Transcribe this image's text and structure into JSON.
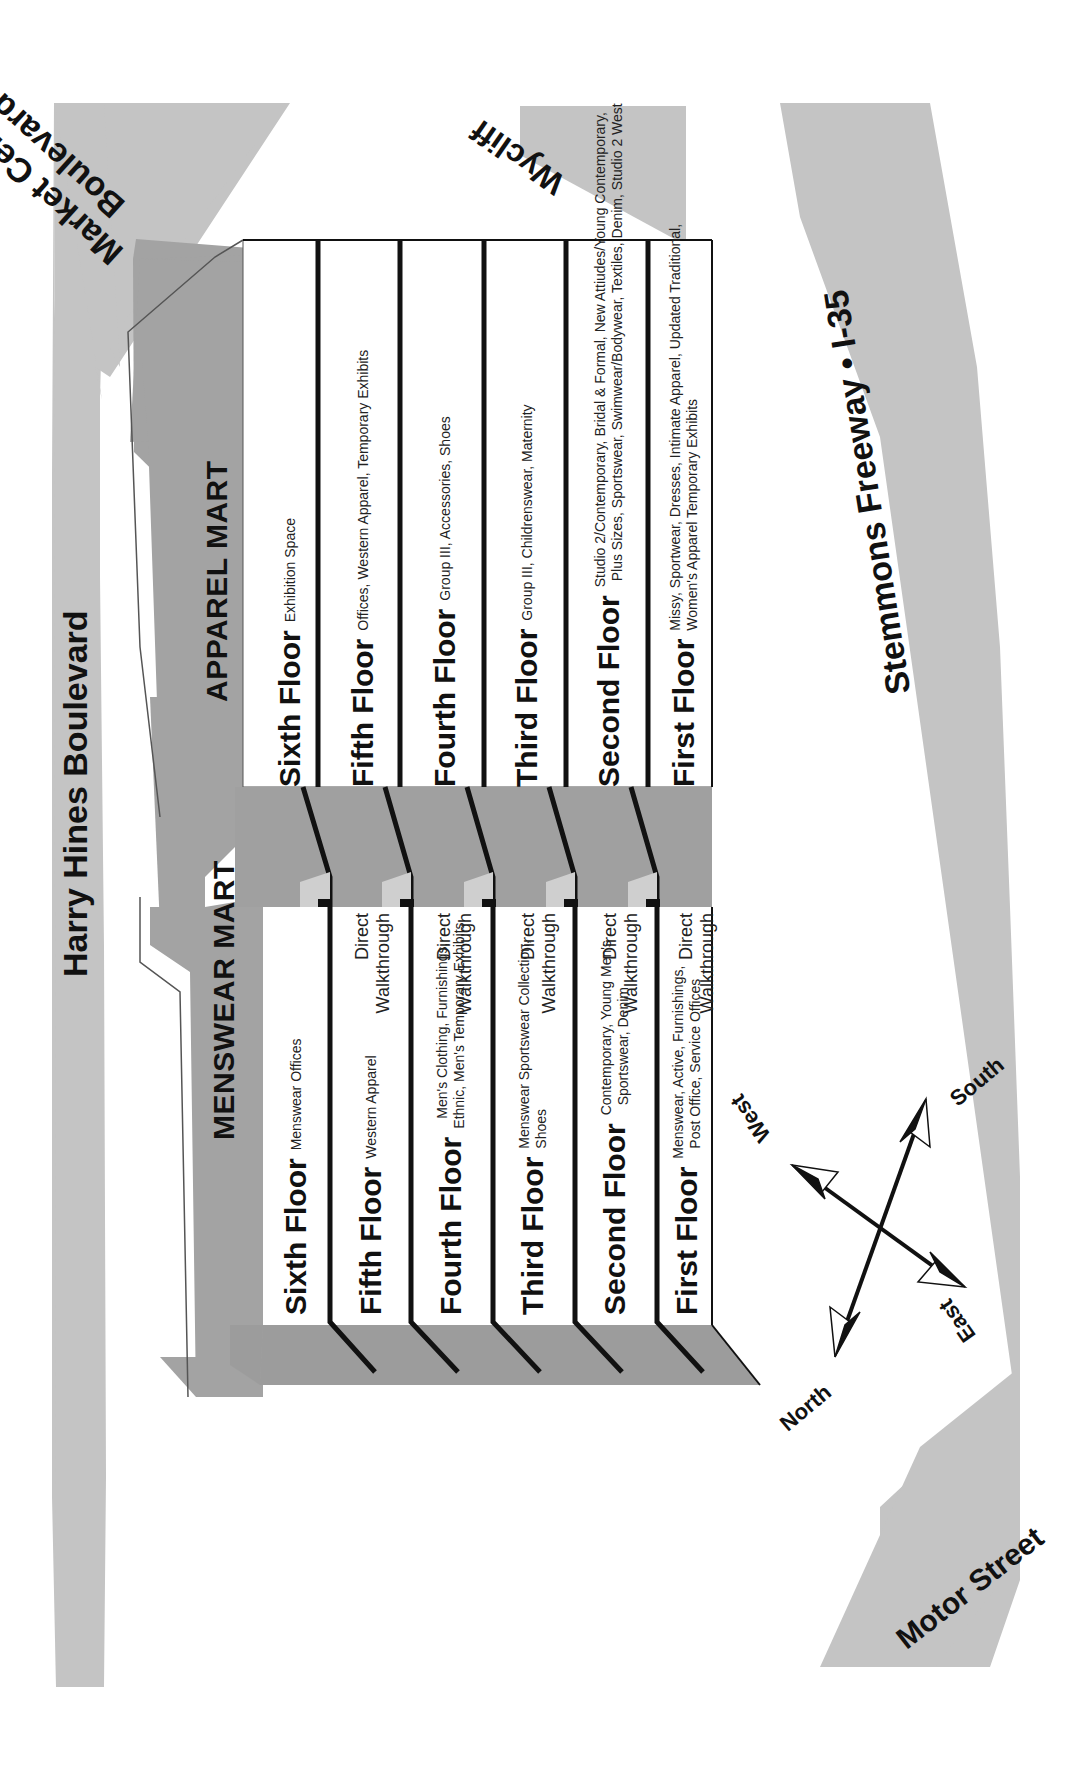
{
  "roads": {
    "harry_hines": "Harry Hines Boulevard",
    "market_center_line1": "Market Center",
    "market_center_line2": "Boulevard",
    "wycliff": "Wycliff",
    "stemmons": "Stemmons Freeway • I-35",
    "motor_street": "Motor Street"
  },
  "buildings": {
    "menswear": {
      "title": "MENSWEAR MART",
      "floors": [
        {
          "name": "Sixth Floor",
          "desc": [
            "Menswear Offices"
          ],
          "walkthrough": false
        },
        {
          "name": "Fifth Floor",
          "desc": [
            "Western Apparel"
          ],
          "walkthrough": true
        },
        {
          "name": "Fourth Floor",
          "desc": [
            "Men's Clothing, Furnishings,",
            "Ethnic, Men's Temporary Exhibits"
          ],
          "walkthrough": true
        },
        {
          "name": "Third Floor",
          "desc": [
            "Menswear Sportswear Collection,",
            "Shoes"
          ],
          "walkthrough": true
        },
        {
          "name": "Second Floor",
          "desc": [
            "Contemporary, Young Men's",
            "Sportswear, Denim"
          ],
          "walkthrough": true
        },
        {
          "name": "First Floor",
          "desc": [
            "Menswear, Active, Furnishings,",
            "Post Office, Service Offices"
          ],
          "walkthrough": true
        }
      ]
    },
    "apparel": {
      "title": "APPAREL MART",
      "floors": [
        {
          "name": "Sixth Floor",
          "desc": [
            "Exhibition Space"
          ]
        },
        {
          "name": "Fifth Floor",
          "desc": [
            "Offices, Western Apparel, Temporary Exhibits"
          ]
        },
        {
          "name": "Fourth Floor",
          "desc": [
            "Group III, Accessories, Shoes"
          ]
        },
        {
          "name": "Third Floor",
          "desc": [
            "Group III, Childrenswear, Maternity"
          ]
        },
        {
          "name": "Second Floor",
          "desc": [
            "Studio 2/Contemporary, Bridal & Formal, New Attiudes/Young Contemporary,",
            "Plus Sizes, Sportswear, Swimwear/Bodywear, Textiles, Denim, Studio 2 West"
          ]
        },
        {
          "name": "First Floor",
          "desc": [
            "Missy, Sportwear, Dresses, Intimate Apparel, Updated Traditional,",
            "Women's Apparel Temporary Exhibits"
          ]
        }
      ]
    }
  },
  "walkthrough": {
    "line1": "Direct",
    "line2": "Walkthrough"
  },
  "compass": {
    "north": "North",
    "south": "South",
    "east": "East",
    "west": "West"
  },
  "colors": {
    "road": "#c4c4c4",
    "building_roof": "#a3a3a3",
    "building_side": "#9c9c9c",
    "floor_face": "#ffffff",
    "floor_divider": "#111111"
  }
}
